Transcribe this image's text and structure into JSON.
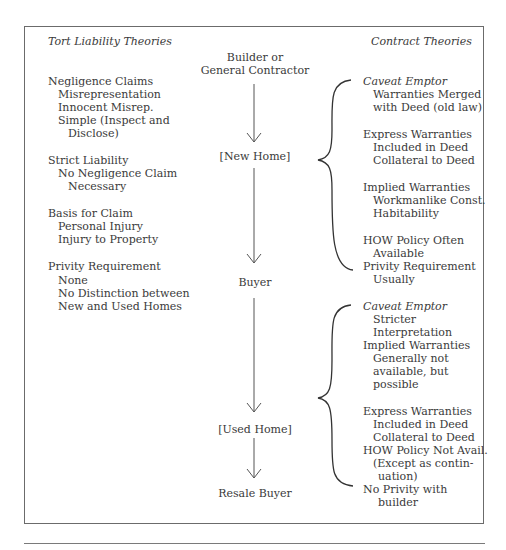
{
  "left_column": {
    "heading": "Tort Liability Theories",
    "groups": [
      {
        "title": "Negligence Claims",
        "items": [
          "Misrepresentation",
          "Innocent Misrep.",
          "Simple (Inspect and",
          "Disclose)"
        ]
      },
      {
        "title": "Strict Liability",
        "items": [
          "No Negligence Claim",
          "Necessary"
        ]
      },
      {
        "title": "Basis for Claim",
        "items": [
          "Personal Injury",
          "Injury to Property"
        ]
      },
      {
        "title": "Privity Requirement",
        "items": [
          "None",
          "No Distinction between",
          "New and Used Homes"
        ]
      }
    ]
  },
  "center_column": {
    "nodes": [
      "Builder or",
      "General Contractor",
      "[New Home]",
      "Buyer",
      "[Used Home]",
      "Resale Buyer"
    ]
  },
  "right_column": {
    "heading": "Contract Theories",
    "new_home": [
      {
        "title": "Caveat Emptor",
        "italic": true,
        "items": [
          "Warranties Merged",
          "with Deed (old law)"
        ]
      },
      {
        "title": "Express Warranties",
        "items": [
          "Included in Deed",
          "Collateral to Deed"
        ]
      },
      {
        "title": "Implied Warranties",
        "items": [
          "Workmanlike Const.",
          "Habitability"
        ]
      },
      {
        "title": "HOW Policy Often",
        "items": [
          "Available"
        ]
      },
      {
        "title": "Privity Requirement",
        "items": [
          "Usually"
        ]
      }
    ],
    "used_home": [
      {
        "title": "Caveat Emptor",
        "italic": true,
        "items": [
          "Stricter",
          "Interpretation"
        ]
      },
      {
        "title": "Implied Warranties",
        "items": [
          "Generally not",
          "available, but",
          "possible"
        ]
      },
      {
        "title": "Express Warranties",
        "items": [
          "Included in Deed",
          "Collateral to Deed"
        ]
      },
      {
        "title": "HOW Policy Not Avail.",
        "items": [
          "(Except as contin-",
          "uation)"
        ]
      },
      {
        "title": "No Privity with",
        "items": [
          "builder"
        ]
      }
    ]
  },
  "colors": {
    "text": "#3a3a3a",
    "line": "#555555",
    "border": "#6b6b6b"
  }
}
